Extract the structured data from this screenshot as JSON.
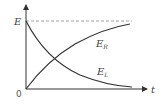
{
  "diagram": {
    "title": "",
    "axes": {
      "x_label": "t",
      "y_label": "",
      "origin_label": "0",
      "y_marker_label": "E"
    },
    "curves": [
      {
        "name": "E_R",
        "label_main": "E",
        "label_sub": "R",
        "shape": "rising exponential approaching E"
      },
      {
        "name": "E_L",
        "label_main": "E",
        "label_sub": "L",
        "shape": "decaying exponential from E toward 0"
      }
    ],
    "asymptote": {
      "label": "E",
      "style": "dashed"
    },
    "colors": {
      "line": "#333333",
      "dashed": "#888888",
      "text": "#444444"
    }
  }
}
